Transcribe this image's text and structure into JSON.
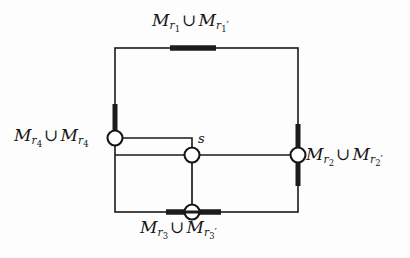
{
  "figure": {
    "kind": "graph-diagram",
    "background_color": "#fdfdfd",
    "stroke_color": "#1a1a1a",
    "node_fill": "#ffffff",
    "marker_color": "#1c1c1c"
  },
  "labels": {
    "top": {
      "name": "label-top",
      "text": "M_{r_1} ∪ M_{r_1'}",
      "left_base": "M",
      "left_sub": "r",
      "left_subsub": "1",
      "operator": "∪",
      "right_base": "M",
      "right_sub": "r",
      "right_subsub": "1",
      "right_prime": "′"
    },
    "left": {
      "name": "label-left",
      "text": "M_{r_4} ∪ M_{r_4}",
      "left_base": "M",
      "left_sub": "r",
      "left_subsub": "4",
      "operator": "∪",
      "right_base": "M",
      "right_sub": "r",
      "right_subsub": "4",
      "right_prime": ""
    },
    "right": {
      "name": "label-right",
      "text": "M_{r_2} ∪ M_{r_2'}",
      "left_base": "M",
      "left_sub": "r",
      "left_subsub": "2",
      "operator": "∪",
      "right_base": "M",
      "right_sub": "r",
      "right_subsub": "2",
      "right_prime": "′"
    },
    "bottom": {
      "name": "label-bottom",
      "text": "M_{r_3} ∪ M_{r_3'}",
      "left_base": "M",
      "left_sub": "r",
      "left_subsub": "3",
      "operator": "∪",
      "right_base": "M",
      "right_sub": "r",
      "right_subsub": "3",
      "right_prime": "′"
    },
    "center_node": {
      "name": "label-s",
      "text": "s"
    }
  },
  "nodes": [
    {
      "id": "left-node",
      "x": 115,
      "y": 138,
      "r": 7.5
    },
    {
      "id": "center-node",
      "x": 192,
      "y": 155,
      "r": 7.5
    },
    {
      "id": "right-node",
      "x": 298,
      "y": 155,
      "r": 7.5
    },
    {
      "id": "bottom-node",
      "x": 192,
      "y": 212,
      "r": 7.5
    }
  ],
  "rectangle": {
    "x1": 115,
    "y1": 48,
    "x2": 298,
    "y2": 212
  },
  "edge_markers": [
    {
      "id": "top-marker",
      "orientation": "horizontal",
      "x1": 170,
      "y1": 48,
      "x2": 216,
      "y2": 48
    },
    {
      "id": "left-marker",
      "orientation": "vertical",
      "x1": 115,
      "y1": 104,
      "x2": 115,
      "y2": 146
    },
    {
      "id": "right-marker",
      "orientation": "vertical",
      "x1": 298,
      "y1": 124,
      "x2": 298,
      "y2": 186
    },
    {
      "id": "bottom-marker",
      "orientation": "horizontal",
      "x1": 166,
      "y1": 212,
      "x2": 221,
      "y2": 212
    }
  ],
  "inner_paths": [
    {
      "id": "left-to-center-path",
      "points": "115,138 192,138 192,155"
    },
    {
      "id": "left-to-right-path",
      "points": "115,155 298,155"
    },
    {
      "id": "center-to-bottom-path",
      "points": "192,155 192,212"
    }
  ]
}
